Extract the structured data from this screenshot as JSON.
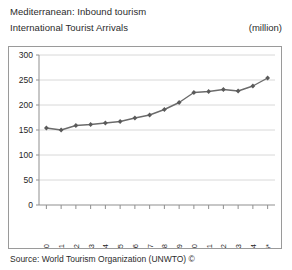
{
  "header": {
    "title_line1": "Mediterranean: Inbound tourism",
    "title_line2": "International Tourist Arrivals",
    "unit": "(million)"
  },
  "footer": {
    "source": "Source: World Tourism Organization (UNWTO) ©"
  },
  "axis": {
    "y_ticks": [
      "0",
      "50",
      "100",
      "150",
      "200",
      "250",
      "300"
    ],
    "x_ticks": [
      "1990",
      "1991",
      "1992",
      "1993",
      "1994",
      "1995",
      "1996",
      "1997",
      "1998",
      "1999",
      "2000",
      "2001",
      "2002",
      "2003",
      "2004",
      "2005*"
    ]
  },
  "style": {
    "line_color": "#6b6b6b",
    "marker_color": "#5a5a5a",
    "grid_color": "#d8d8d8",
    "axis_color": "#8f8f8f",
    "frame_color": "#9a9a9a"
  },
  "chart_data": {
    "type": "line",
    "subtitle": "International Tourist Arrivals",
    "xlabel": "",
    "ylabel": "(million)",
    "ylim": [
      0,
      300
    ],
    "ytick_step": 50,
    "grid": true,
    "legend": false,
    "categories": [
      "1990",
      "1991",
      "1992",
      "1993",
      "1994",
      "1995",
      "1996",
      "1997",
      "1998",
      "1999",
      "2000",
      "2001",
      "2002",
      "2003",
      "2004",
      "2005*"
    ],
    "values": [
      154,
      150,
      159,
      161,
      164,
      167,
      174,
      180,
      191,
      205,
      225,
      227,
      231,
      228,
      238,
      254
    ],
    "annotations": [
      "* provisional / estimated figure for 2005"
    ]
  }
}
